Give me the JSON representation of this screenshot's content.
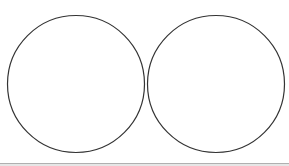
{
  "diagram": {
    "type": "two-circles",
    "stroke_color": "#333333",
    "fill_color": "#ffffff",
    "circles": [
      {
        "label": "",
        "cx": 76,
        "cy": 84,
        "r": 68.5
      },
      {
        "label": "",
        "cx": 216,
        "cy": 84,
        "r": 68.5
      }
    ]
  },
  "bottom_bar": {
    "color": "#b0b0b0"
  }
}
